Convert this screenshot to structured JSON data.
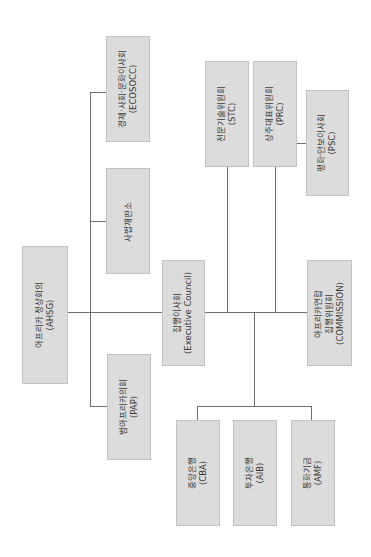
{
  "diagram": {
    "type": "org-chart",
    "orientation": "rotated-90-ccw",
    "box_fill": "#dcdcdc",
    "line_color": "#6e6e6e",
    "nodes": {
      "ahsg": {
        "line1": "아프리카 정상회의",
        "line2": "(AHSG)"
      },
      "ecosocc": {
        "line1": "경제·사회·문화이사회",
        "line2": "(ECOSOCC)"
      },
      "court": {
        "line1": "사법재판소"
      },
      "pap": {
        "line1": "범아프리카의회",
        "line2": "(PAP)"
      },
      "executive": {
        "line1": "집행이사회",
        "line2": "(Executive Council)"
      },
      "stc": {
        "line1": "전문기술위원회",
        "line2": "(STC)"
      },
      "prc": {
        "line1": "상주대표위원회",
        "line2": "(PRC)"
      },
      "psc": {
        "line1": "평화·안보이사회",
        "line2": "(PSC)"
      },
      "commission": {
        "line1": "아프리카연합",
        "line2": "집행위원회",
        "line3": "(COMMISSION)"
      },
      "cba": {
        "line1": "중앙은행",
        "line2": "(CBA)"
      },
      "aib": {
        "line1": "투자은행",
        "line2": "(AIB)"
      },
      "amf": {
        "line1": "통화기금",
        "line2": "(AMF)"
      }
    },
    "edges": [
      [
        "ahsg",
        "executive"
      ],
      [
        "ahsg",
        "ecosocc"
      ],
      [
        "ahsg",
        "court"
      ],
      [
        "ahsg",
        "pap"
      ],
      [
        "executive",
        "stc"
      ],
      [
        "executive",
        "prc"
      ],
      [
        "prc",
        "psc"
      ],
      [
        "executive",
        "commission"
      ],
      [
        "executive",
        "cba"
      ],
      [
        "executive",
        "aib"
      ],
      [
        "executive",
        "amf"
      ]
    ]
  }
}
